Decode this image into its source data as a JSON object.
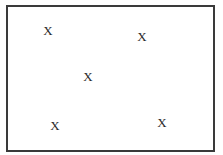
{
  "diagram": {
    "frame": {
      "border_color": "#3a3a3a"
    },
    "marks": [
      {
        "label": "X",
        "x": 48,
        "y": 30
      },
      {
        "label": "X",
        "x": 142,
        "y": 36
      },
      {
        "label": "X",
        "x": 88,
        "y": 76
      },
      {
        "label": "X",
        "x": 55,
        "y": 125
      },
      {
        "label": "X",
        "x": 162,
        "y": 122
      }
    ]
  }
}
